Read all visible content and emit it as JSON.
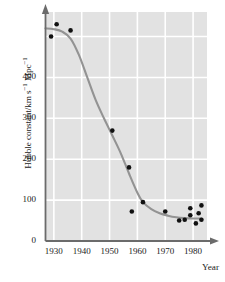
{
  "chart_data": {
    "type": "scatter",
    "title": "",
    "xlabel": "Year",
    "ylabel": "Hubble constant/km s⁻¹ Mpc⁻¹",
    "ylabel_main": "Hubble constant/km s",
    "ylabel_sup1": "−1",
    "ylabel_mid": " Mpc",
    "ylabel_sup2": "−1",
    "xlim": [
      1927,
      1985
    ],
    "ylim": [
      0,
      560
    ],
    "xticks": [
      1930,
      1940,
      1950,
      1960,
      1970,
      1980
    ],
    "xtick_labels": [
      "1930",
      "1940",
      "1950",
      "1960",
      "1970",
      "1980"
    ],
    "yticks": [
      0,
      100,
      200,
      300,
      400
    ],
    "ytick_labels": [
      "0",
      "100",
      "200",
      "300",
      "400"
    ],
    "grid": "white gridlines on light gray panel",
    "grid_color": "#ffffff",
    "panel_color": "#e2e2e2",
    "axis_color": "#6b6b6b",
    "point_color": "#111111",
    "curve_color": "#939393",
    "legend": null,
    "points": [
      {
        "x": 1929,
        "y": 500
      },
      {
        "x": 1931,
        "y": 530
      },
      {
        "x": 1936,
        "y": 515
      },
      {
        "x": 1951,
        "y": 270
      },
      {
        "x": 1957,
        "y": 180
      },
      {
        "x": 1958,
        "y": 72
      },
      {
        "x": 1962,
        "y": 95
      },
      {
        "x": 1970,
        "y": 72
      },
      {
        "x": 1975,
        "y": 50
      },
      {
        "x": 1977,
        "y": 52
      },
      {
        "x": 1979,
        "y": 80
      },
      {
        "x": 1979,
        "y": 63
      },
      {
        "x": 1981,
        "y": 43
      },
      {
        "x": 1982,
        "y": 68
      },
      {
        "x": 1983,
        "y": 87
      },
      {
        "x": 1983,
        "y": 52
      }
    ],
    "curve": [
      {
        "x": 1927,
        "y": 520
      },
      {
        "x": 1930,
        "y": 518
      },
      {
        "x": 1933,
        "y": 512
      },
      {
        "x": 1936,
        "y": 495
      },
      {
        "x": 1939,
        "y": 455
      },
      {
        "x": 1942,
        "y": 400
      },
      {
        "x": 1945,
        "y": 345
      },
      {
        "x": 1948,
        "y": 300
      },
      {
        "x": 1951,
        "y": 258
      },
      {
        "x": 1954,
        "y": 215
      },
      {
        "x": 1957,
        "y": 165
      },
      {
        "x": 1960,
        "y": 118
      },
      {
        "x": 1962,
        "y": 95
      },
      {
        "x": 1965,
        "y": 78
      },
      {
        "x": 1968,
        "y": 68
      },
      {
        "x": 1971,
        "y": 62
      },
      {
        "x": 1974,
        "y": 58
      },
      {
        "x": 1977,
        "y": 56
      },
      {
        "x": 1980,
        "y": 55
      },
      {
        "x": 1983,
        "y": 55
      }
    ]
  }
}
